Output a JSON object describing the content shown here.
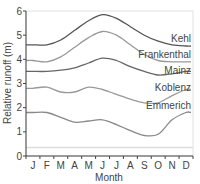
{
  "chart_data": {
    "type": "line",
    "title": "",
    "xlabel": "Month",
    "ylabel": "Relative runoff (m)",
    "ylim": [
      0,
      6
    ],
    "yticks": [
      0,
      1,
      2,
      3,
      4,
      5,
      6
    ],
    "grid": false,
    "legend": "inline labels at right end of each line",
    "categories": [
      "J",
      "F",
      "M",
      "A",
      "M",
      "J",
      "J",
      "A",
      "S",
      "O",
      "N",
      "D"
    ],
    "series": [
      {
        "name": "Kehl",
        "color": "#555555",
        "values": [
          4.6,
          4.6,
          4.8,
          5.2,
          5.6,
          5.85,
          5.7,
          5.35,
          5.0,
          4.75,
          4.6,
          4.55
        ]
      },
      {
        "name": "Frankenthal",
        "color": "#999999",
        "values": [
          3.95,
          3.9,
          4.1,
          4.5,
          4.9,
          5.15,
          5.0,
          4.6,
          4.2,
          3.95,
          3.9,
          3.9
        ]
      },
      {
        "name": "Mainz",
        "color": "#666666",
        "values": [
          3.5,
          3.5,
          3.55,
          3.65,
          3.85,
          4.05,
          3.95,
          3.7,
          3.5,
          3.35,
          3.4,
          3.5
        ]
      },
      {
        "name": "Koblenz",
        "color": "#999999",
        "values": [
          2.8,
          2.85,
          2.65,
          2.65,
          2.85,
          2.75,
          2.55,
          2.35,
          2.2,
          2.2,
          2.5,
          2.75
        ]
      },
      {
        "name": "Emmerich",
        "color": "#888888",
        "values": [
          1.8,
          1.8,
          1.6,
          1.4,
          1.45,
          1.5,
          1.3,
          1.05,
          0.85,
          0.9,
          1.5,
          1.8
        ]
      }
    ],
    "reference_line": {
      "value": 0.35,
      "color": "#dddddd"
    }
  },
  "axes": {
    "ylabel": "Relative runoff (m)",
    "xlabel": "Month",
    "yticks": [
      "0",
      "1",
      "2",
      "3",
      "4",
      "5",
      "6"
    ],
    "xticks": [
      "J",
      "F",
      "M",
      "A",
      "M",
      "J",
      "J",
      "A",
      "S",
      "O",
      "N",
      "D"
    ]
  }
}
